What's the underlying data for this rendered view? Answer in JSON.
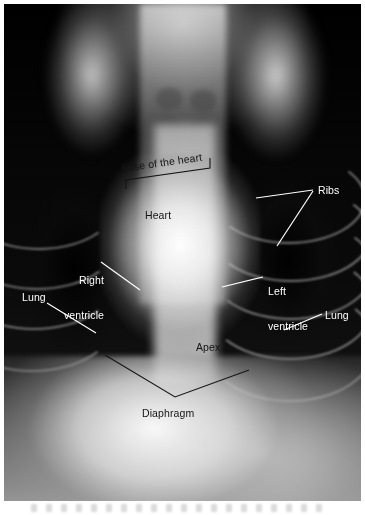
{
  "figure": {
    "kind": "radiograph",
    "modality_view": "dorsoventral thoracic radiograph",
    "plate": {
      "background_color": "#050505",
      "border_color": "#ffffff"
    }
  },
  "annotations": {
    "light_color": "#ffffff",
    "dark_color": "#141414",
    "items": [
      {
        "id": "base-of-the-heart",
        "label": "Base of the heart",
        "text_color": "#141414",
        "marker": "bracket",
        "rotation_deg": -8,
        "x": 122,
        "y": 163
      },
      {
        "id": "heart",
        "label": "Heart",
        "text_color": "#141414",
        "marker": "none",
        "x": 145,
        "y": 210
      },
      {
        "id": "ribs",
        "label": "Ribs",
        "text_color": "#ffffff",
        "marker": "two-leader-lines",
        "x": 318,
        "y": 185
      },
      {
        "id": "right-ventricle",
        "label": "Right\nventricle",
        "line1": "Right",
        "line2": "ventricle",
        "text_color": "#ffffff",
        "marker": "leader-line",
        "x": 42,
        "y": 252
      },
      {
        "id": "left-ventricle",
        "label": "Left\nventricle",
        "line1": "Left",
        "line2": "ventricle",
        "text_color": "#ffffff",
        "marker": "leader-line",
        "x": 268,
        "y": 263
      },
      {
        "id": "lung-left",
        "label": "Lung",
        "text_color": "#ffffff",
        "marker": "leader-line",
        "x": 22,
        "y": 292
      },
      {
        "id": "lung-right",
        "label": "Lung",
        "text_color": "#ffffff",
        "marker": "leader-line",
        "x": 325,
        "y": 310
      },
      {
        "id": "apex",
        "label": "Apex",
        "text_color": "#141414",
        "marker": "none",
        "x": 196,
        "y": 342
      },
      {
        "id": "diaphragm",
        "label": "Diaphragm",
        "text_color": "#141414",
        "marker": "chevron",
        "x": 142,
        "y": 408
      }
    ]
  }
}
